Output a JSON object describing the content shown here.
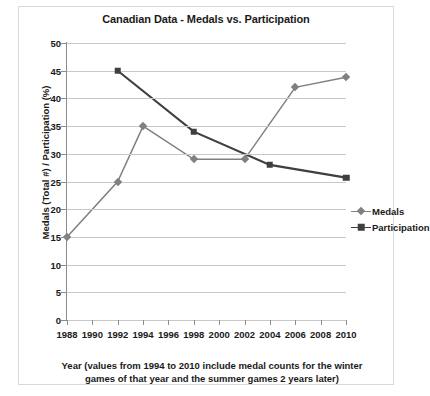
{
  "chart_data": {
    "type": "line",
    "title": "Canadian Data - Medals vs. Participation",
    "xlabel": "Year (values from 1994 to 2010 include medal counts for the winter games of that year and the summer games 2 years later)",
    "ylabel": "Medals (Total #) / Participation (%)",
    "x": [
      1988,
      1990,
      1992,
      1994,
      1996,
      1998,
      2000,
      2002,
      2004,
      2006,
      2008,
      2010
    ],
    "xticks": [
      "1988",
      "1990",
      "1992",
      "1994",
      "1996",
      "1998",
      "2000",
      "2002",
      "2004",
      "2006",
      "2008",
      "2010"
    ],
    "yticks": [
      "0",
      "5",
      "10",
      "15",
      "20",
      "25",
      "30",
      "35",
      "40",
      "45",
      "50"
    ],
    "ylim": [
      0,
      50
    ],
    "xlim": [
      1988,
      2010
    ],
    "grid": "horizontal",
    "legend_position": "right",
    "series": [
      {
        "name": "Medals",
        "color": "#808080",
        "marker": "diamond",
        "points": [
          {
            "x": 1988,
            "y": 15
          },
          {
            "x": 1992,
            "y": 25
          },
          {
            "x": 1994,
            "y": 35
          },
          {
            "x": 1998,
            "y": 29
          },
          {
            "x": 2002,
            "y": 29
          },
          {
            "x": 2006,
            "y": 42
          },
          {
            "x": 2010,
            "y": 43.8
          }
        ]
      },
      {
        "name": "Participation",
        "color": "#3f3f3f",
        "marker": "square",
        "points": [
          {
            "x": 1992,
            "y": 45
          },
          {
            "x": 1998,
            "y": 34
          },
          {
            "x": 2004,
            "y": 28
          },
          {
            "x": 2010,
            "y": 25.7
          }
        ]
      }
    ]
  },
  "legend": {
    "items": [
      {
        "label": "Medals"
      },
      {
        "label": "Participation"
      }
    ]
  }
}
